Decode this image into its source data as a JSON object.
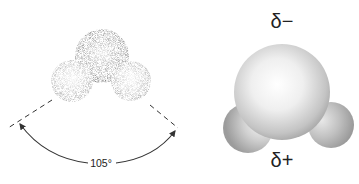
{
  "figure": {
    "left_model": {
      "description": "Stippled space-filling water molecule with bond angle",
      "angle_label": "105°"
    },
    "right_model": {
      "description": "Shaded space-filling water molecule showing partial charges",
      "charge_top": "δ−",
      "charge_bottom": "δ+"
    }
  },
  "colors": {
    "stipple": "#8a8a8a",
    "shade_dark": "#9a9a9a",
    "shade_light": "#f4f4f4",
    "line": "#333333"
  }
}
